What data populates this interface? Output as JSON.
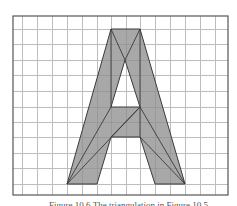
{
  "figure": {
    "type": "grid-diagram",
    "frame": {
      "left": 13,
      "top": 16,
      "right": 228,
      "bottom": 195
    },
    "grid": {
      "vertical_lines": [
        22,
        37,
        52,
        67,
        82,
        97,
        111,
        126,
        140,
        155,
        170,
        185,
        200,
        215
      ],
      "horizontal_lines": [
        29,
        44,
        60,
        75,
        91,
        107,
        122,
        137,
        153,
        168,
        184
      ],
      "color": "#bdbdbd"
    },
    "fill_color": "#a9a9a9",
    "edge_color": "#3a3a3a",
    "polygon": {
      "outer": [
        [
          111,
          29
        ],
        [
          140,
          29
        ],
        [
          185,
          184
        ],
        [
          155,
          184
        ],
        [
          140,
          137
        ],
        [
          111,
          137
        ],
        [
          97,
          184
        ],
        [
          67,
          184
        ]
      ],
      "hole": [
        [
          125,
          60
        ],
        [
          140,
          107
        ],
        [
          111,
          107
        ]
      ]
    },
    "diagonals": [
      [
        [
          111,
          29
        ],
        [
          125,
          60
        ]
      ],
      [
        [
          140,
          29
        ],
        [
          125,
          60
        ]
      ],
      [
        [
          111,
          29
        ],
        [
          111,
          107
        ]
      ],
      [
        [
          140,
          29
        ],
        [
          140,
          107
        ]
      ],
      [
        [
          67,
          184
        ],
        [
          111,
          107
        ]
      ],
      [
        [
          67,
          184
        ],
        [
          140,
          107
        ]
      ],
      [
        [
          140,
          107
        ],
        [
          111,
          137
        ]
      ],
      [
        [
          140,
          107
        ],
        [
          140,
          137
        ]
      ],
      [
        [
          185,
          184
        ],
        [
          140,
          107
        ]
      ],
      [
        [
          185,
          184
        ],
        [
          140,
          137
        ]
      ]
    ]
  },
  "caption": {
    "text": "Figure 10.6 The triangulation in Figure 10.5"
  }
}
